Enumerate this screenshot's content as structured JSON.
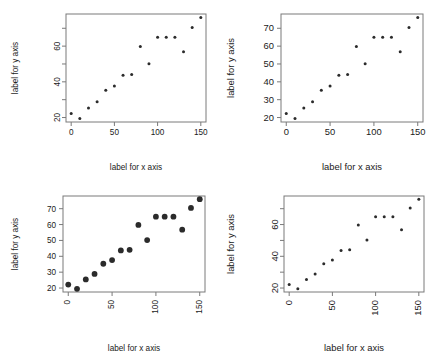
{
  "figure": {
    "panel_count": 4,
    "background": "#ffffff",
    "point_color": "#2b2b2b",
    "axis_color": "#7a7a7a"
  },
  "chart_data": [
    {
      "type": "scatter",
      "title": "",
      "xlabel": "label for x axis",
      "ylabel": "label for y axis",
      "x": [
        0,
        10,
        20,
        30,
        40,
        50,
        60,
        70,
        80,
        90,
        100,
        110,
        120,
        130,
        140,
        150
      ],
      "y": [
        22.2,
        19.5,
        25.4,
        28.9,
        35.3,
        37.6,
        43.7,
        44.1,
        59.8,
        50.2,
        65.0,
        65.0,
        65.0,
        56.8,
        70.5,
        76.0
      ],
      "xlim": [
        -6,
        156
      ],
      "ylim": [
        17.5,
        78.0
      ],
      "xticks": [
        0,
        50,
        100,
        150
      ],
      "xticklabels": [
        "0",
        "50",
        "100",
        "150"
      ],
      "yticks": [
        20,
        40,
        60
      ],
      "yticklabels": [
        "20",
        "40",
        "60"
      ],
      "yminorticks": [
        30,
        50,
        70
      ],
      "xtick_rotation": 0,
      "ytick_rotation": 90,
      "label_size": "small",
      "point_size": "small",
      "grid": false,
      "legend": "none"
    },
    {
      "type": "scatter",
      "title": "",
      "xlabel": "label for x axis",
      "ylabel": "label for y axis",
      "x": [
        0,
        10,
        20,
        30,
        40,
        50,
        60,
        70,
        80,
        90,
        100,
        110,
        120,
        130,
        140,
        150
      ],
      "y": [
        22.2,
        19.5,
        25.4,
        28.9,
        35.3,
        37.6,
        43.7,
        44.1,
        59.8,
        50.2,
        65.0,
        65.0,
        65.0,
        56.8,
        70.5,
        76.0
      ],
      "xlim": [
        -6,
        156
      ],
      "ylim": [
        17.5,
        78.0
      ],
      "xticks": [
        0,
        50,
        100,
        150
      ],
      "xticklabels": [
        "0",
        "50",
        "100",
        "150"
      ],
      "yticks": [
        20,
        30,
        40,
        50,
        60,
        70
      ],
      "yticklabels": [
        "20",
        "30",
        "40",
        "50",
        "60",
        "70"
      ],
      "yminorticks": [],
      "xtick_rotation": 0,
      "ytick_rotation": 0,
      "label_size": "large",
      "point_size": "small",
      "grid": false,
      "legend": "none"
    },
    {
      "type": "scatter",
      "title": "",
      "xlabel": "label for x axis",
      "ylabel": "label for y axis",
      "x": [
        0,
        10,
        20,
        30,
        40,
        50,
        60,
        70,
        80,
        90,
        100,
        110,
        120,
        130,
        140,
        150
      ],
      "y": [
        22.2,
        19.5,
        25.4,
        28.9,
        35.3,
        37.6,
        43.7,
        44.1,
        59.8,
        50.2,
        65.0,
        65.0,
        65.0,
        56.8,
        70.5,
        76.0
      ],
      "xlim": [
        -6,
        156
      ],
      "ylim": [
        17.5,
        78.0
      ],
      "xticks": [
        0,
        50,
        100,
        150
      ],
      "xticklabels": [
        "0",
        "50",
        "100",
        "150"
      ],
      "yticks": [
        20,
        30,
        40,
        50,
        60,
        70
      ],
      "yticklabels": [
        "20",
        "30",
        "40",
        "50",
        "60",
        "70"
      ],
      "yminorticks": [],
      "xtick_rotation": 90,
      "ytick_rotation": 0,
      "label_size": "small",
      "point_size": "large",
      "grid": false,
      "legend": "none"
    },
    {
      "type": "scatter",
      "title": "",
      "xlabel": "label for x axis",
      "ylabel": "label for y axis",
      "x": [
        0,
        10,
        20,
        30,
        40,
        50,
        60,
        70,
        80,
        90,
        100,
        110,
        120,
        130,
        140,
        150
      ],
      "y": [
        22.2,
        19.5,
        25.4,
        28.9,
        35.3,
        37.6,
        43.7,
        44.1,
        59.8,
        50.2,
        65.0,
        65.0,
        65.0,
        56.8,
        70.5,
        76.0
      ],
      "xlim": [
        -6,
        156
      ],
      "ylim": [
        17.5,
        78.0
      ],
      "xticks": [
        0,
        50,
        100,
        150
      ],
      "xticklabels": [
        "0",
        "50",
        "100",
        "150"
      ],
      "yticks": [
        20,
        40,
        60
      ],
      "yticklabels": [
        "20",
        "40",
        "60"
      ],
      "yminorticks": [
        30,
        50,
        70
      ],
      "xtick_rotation": 90,
      "ytick_rotation": 90,
      "label_size": "large",
      "point_size": "small",
      "grid": false,
      "legend": "none"
    }
  ]
}
